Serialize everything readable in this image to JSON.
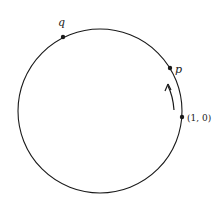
{
  "diagram": {
    "type": "unit-circle",
    "points": [
      {
        "id": "q",
        "label": "q"
      },
      {
        "id": "p",
        "label": "p"
      },
      {
        "id": "origin-point",
        "label": "(1, 0)"
      }
    ],
    "arrow": {
      "direction": "counterclockwise",
      "from": "(1, 0)",
      "toward": "p"
    },
    "colors": {
      "stroke": "#1a1a1a",
      "background": "#ffffff"
    }
  }
}
